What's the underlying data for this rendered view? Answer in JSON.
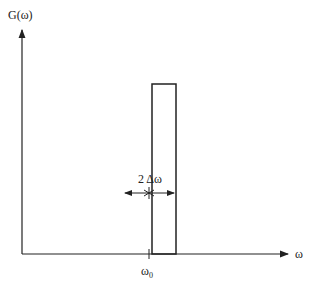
{
  "diagram": {
    "y_axis_label": "G(ω)",
    "x_axis_label": "ω",
    "center_label": "ω",
    "center_subscript": "0",
    "width_label": "2 Δω",
    "colors": {
      "line": "#222222",
      "background": "#ffffff"
    }
  }
}
